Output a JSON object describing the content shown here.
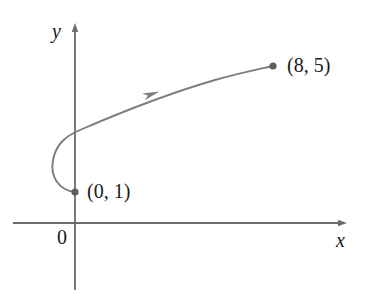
{
  "figure": {
    "kind": "parametric-curve-plot",
    "background_color": "#ffffff",
    "axis_color": "#6b6b6b",
    "curve_color": "#7d7d7d",
    "point_color": "#5e5e5e",
    "text_color": "#1a1a1a",
    "axes": {
      "x_axis_label": "x",
      "y_axis_label": "y",
      "origin_label": "0",
      "x_axis_y_px": 223,
      "y_axis_x_px": 75,
      "x_axis_from_px": 13,
      "x_axis_to_px": 345,
      "y_axis_from_px": 25,
      "y_axis_to_px": 290,
      "arrowheads": [
        "x-positive",
        "y-positive"
      ],
      "grid": false,
      "ticks": []
    },
    "points": [
      {
        "name": "start-point",
        "label": "(0, 1)",
        "x": 0,
        "y": 1,
        "px": 75,
        "py": 192,
        "label_px": 87,
        "label_py": 181
      },
      {
        "name": "end-point",
        "label": "(8, 5)",
        "x": 8,
        "y": 5,
        "px": 273,
        "py": 66,
        "label_px": 287,
        "label_py": 55
      }
    ],
    "curve": {
      "name": "oriented-parametric-curve",
      "direction": "from (0, 1) to (8, 5)",
      "path": "M 75 192 C 58 190 50 176 53 160 C 56 144 66 136 80 130 C 110 117 160 96 215 80 C 240 73 260 69 273 66",
      "direction_marker": {
        "name": "direction-arrow",
        "px": 152,
        "py": 94,
        "angle_deg": -19
      }
    },
    "chart_data": {
      "type": "line",
      "title": "",
      "xlabel": "x",
      "ylabel": "y",
      "grid": false,
      "legend": null,
      "annotations": [
        "(0, 1)",
        "(8, 5)",
        "0",
        "direction arrow along curve"
      ],
      "series": [
        {
          "name": "oriented-parametric-curve",
          "endpoints_labeled": [
            "(0, 1)",
            "(8, 5)"
          ],
          "x": [
            0,
            -0.85,
            -1.05,
            -0.75,
            -0.2,
            0.6,
            2.0,
            3.6,
            5.2,
            6.6,
            7.5,
            8
          ],
          "y": [
            1.0,
            1.15,
            1.7,
            2.25,
            2.6,
            3.0,
            3.45,
            3.85,
            4.25,
            4.6,
            4.85,
            5.0
          ]
        }
      ]
    }
  }
}
